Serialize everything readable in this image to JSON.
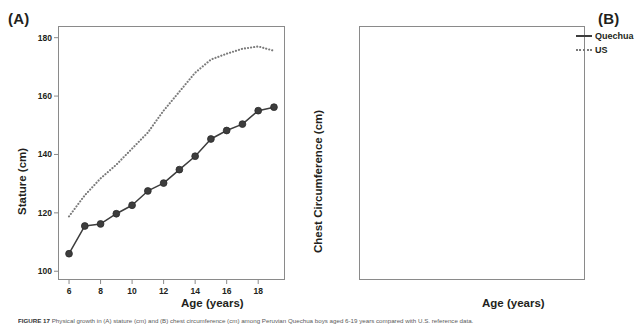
{
  "figure": {
    "panel_a_label": "(A)",
    "panel_b_label": "(B)",
    "caption_prefix": "FIGURE 17",
    "caption_text": "Physical growth in (A) stature (cm) and (B) chest circumference (cm) among Peruvian Quechua boys aged 6-19 years compared with U.S. reference data."
  },
  "legend": {
    "position": "right",
    "entries": [
      {
        "label": "Quechua",
        "style": "solid",
        "color": "#3d3d3d"
      },
      {
        "label": "US",
        "style": "dotted",
        "color": "#7a7a7a"
      }
    ]
  },
  "chart_data": [
    {
      "type": "line",
      "panel": "(A)",
      "title": "",
      "xlabel": "Age (years)",
      "ylabel": "Stature (cm)",
      "xlim": [
        5.3,
        19.7
      ],
      "ylim": [
        97,
        184
      ],
      "xticks": [
        6,
        8,
        10,
        12,
        14,
        16,
        18
      ],
      "yticks": [
        100,
        120,
        140,
        160,
        180
      ],
      "grid": false,
      "x": [
        6,
        7,
        8,
        9,
        10,
        11,
        12,
        13,
        14,
        15,
        16,
        17,
        18,
        19
      ],
      "series": [
        {
          "name": "Quechua",
          "style": "solid",
          "markers": true,
          "color": "#3d3d3d",
          "values": [
            106.0,
            115.5,
            116.2,
            119.7,
            122.6,
            127.5,
            130.2,
            134.8,
            139.4,
            145.3,
            148.2,
            150.4,
            155.0,
            156.2
          ]
        },
        {
          "name": "US",
          "style": "dotted",
          "markers": false,
          "color": "#7a7a7a",
          "values": [
            118.8,
            126.0,
            131.8,
            136.5,
            142.0,
            147.5,
            155.0,
            161.5,
            168.0,
            172.5,
            174.5,
            176.2,
            177.0,
            175.5
          ]
        }
      ]
    },
    {
      "type": "line",
      "panel": "(B)",
      "title": "",
      "xlabel": "Age (years)",
      "ylabel": "Chest Circumference (cm)",
      "xlim": [
        5.3,
        19.7
      ],
      "ylim": [
        58.5,
        91.5
      ],
      "xticks": [
        6,
        8,
        10,
        12,
        14,
        16,
        18
      ],
      "yticks": [
        60,
        65,
        70,
        75,
        80,
        85,
        90
      ],
      "grid": false,
      "x": [
        6,
        7,
        8,
        9,
        10,
        11,
        12,
        13,
        14,
        15,
        16,
        17,
        18,
        19
      ],
      "series": [
        {
          "name": "Quechua",
          "style": "solid",
          "markers": true,
          "color": "#3d3d3d",
          "values": [
            62.5,
            63.8,
            64.5,
            66.5,
            68.9,
            70.0,
            72.0,
            74.2,
            77.3,
            79.9,
            81.4,
            84.9,
            84.9,
            85.9
          ]
        },
        {
          "name": "US",
          "style": "dotted",
          "markers": false,
          "color": "#7a7a7a",
          "values": [
            62.4,
            62.4,
            63.3,
            65.3,
            67.6,
            69.5,
            71.6,
            74.0,
            76.6,
            78.6,
            80.4,
            82.0,
            83.2,
            84.0
          ]
        }
      ]
    }
  ]
}
